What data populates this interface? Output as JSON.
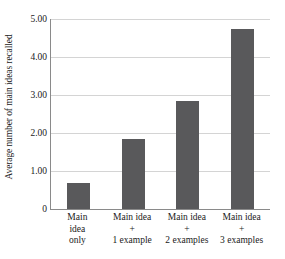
{
  "chart_data": {
    "type": "bar",
    "title": "",
    "xlabel": "",
    "ylabel": "Average number of main ideas recalled",
    "categories": [
      "Main idea only",
      "Main idea + 1 example",
      "Main idea + 2 examples",
      "Main idea + 3 examples"
    ],
    "category_lines": [
      [
        "Main",
        "idea",
        "only"
      ],
      [
        "Main idea",
        "+",
        "1 example"
      ],
      [
        "Main idea",
        "+",
        "2 examples"
      ],
      [
        "Main idea",
        "+",
        "3 examples"
      ]
    ],
    "values": [
      0.68,
      1.84,
      2.84,
      4.74
    ],
    "ylim": [
      0,
      5
    ],
    "yticks": [
      0,
      1,
      2,
      3,
      4,
      5
    ],
    "ytick_labels": [
      "0",
      "1.00",
      "2.00",
      "3.00",
      "4.00",
      "5.00"
    ],
    "grid": true,
    "legend": "none",
    "bar_color": "#59595b",
    "gridline_color": "#d4d4d4",
    "axis_color": "#8a8a8a"
  }
}
